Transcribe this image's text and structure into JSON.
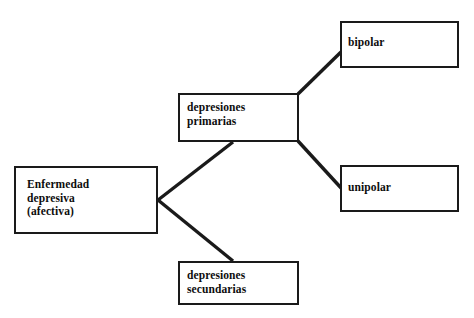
{
  "diagram": {
    "language": "es",
    "background_color": "#ffffff",
    "line_color": "#1a1a1a",
    "text_color": "#0d0d0d",
    "nodes": {
      "root": {
        "label": "Enfermedad\ndepresiva\n(afectiva)",
        "lines": [
          "Enfermedad",
          "depresiva",
          "(afectiva)"
        ]
      },
      "primarias": {
        "label": "depresiones\nprimarias",
        "lines": [
          "depresiones",
          "primarias"
        ]
      },
      "secundarias": {
        "label": "depresiones\nsecundarias",
        "lines": [
          "depresiones",
          "secundarias"
        ]
      },
      "bipolar": {
        "label": "bipolar",
        "lines": [
          "bipolar"
        ]
      },
      "unipolar": {
        "label": "unipolar",
        "lines": [
          "unipolar"
        ]
      }
    },
    "edges": [
      {
        "from": "root",
        "to": "primarias"
      },
      {
        "from": "root",
        "to": "secundarias"
      },
      {
        "from": "primarias",
        "to": "bipolar"
      },
      {
        "from": "primarias",
        "to": "unipolar"
      }
    ]
  }
}
